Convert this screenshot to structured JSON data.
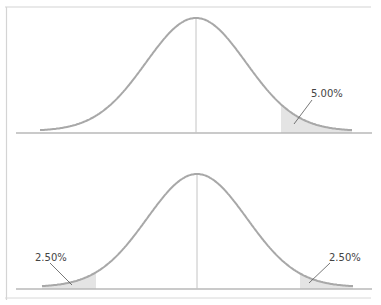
{
  "chart_data": [
    {
      "type": "area",
      "title": "",
      "description": "Standard normal distribution, one-tailed test",
      "xlabel": "",
      "ylabel": "",
      "grid": false,
      "shaded_regions": [
        {
          "tail": "right",
          "area_percent": 5.0,
          "label": "5.00%"
        }
      ],
      "center_line": true
    },
    {
      "type": "area",
      "title": "",
      "description": "Standard normal distribution, two-tailed test",
      "xlabel": "",
      "ylabel": "",
      "grid": false,
      "shaded_regions": [
        {
          "tail": "left",
          "area_percent": 2.5,
          "label": "2.50%"
        },
        {
          "tail": "right",
          "area_percent": 2.5,
          "label": "2.50%"
        }
      ],
      "center_line": true
    }
  ],
  "colors": {
    "curve": "#a8a8a8",
    "shade": "#e4e4e4",
    "axis": "#b8b8b8",
    "border": "#d0d0d0",
    "label": "#444444",
    "leader": "#555555"
  },
  "labels": {
    "top_right": "5.00%",
    "bottom_left": "2.50%",
    "bottom_right": "2.50%"
  }
}
